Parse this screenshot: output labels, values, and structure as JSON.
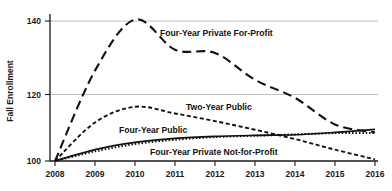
{
  "chart_data": {
    "type": "line",
    "title": "",
    "xlabel": "",
    "ylabel": "Fall Enrollment",
    "x": [
      2008,
      2009,
      2010,
      2011,
      2012,
      2013,
      2014,
      2015,
      2016
    ],
    "xtick_labels": [
      "2008",
      "2009",
      "2010",
      "2011",
      "2012",
      "2013",
      "2014",
      "2015",
      "2016"
    ],
    "ytick_labels": [
      "100",
      "120",
      "140"
    ],
    "yticks": [
      100,
      120,
      140
    ],
    "ylim": [
      100,
      144
    ],
    "xlim": [
      2008,
      2016
    ],
    "grid": "horizontal",
    "legend_position": "inline-annotations",
    "index_base_note": "2008 = 100",
    "series": [
      {
        "name": "Four-Year Private For-Profit",
        "style": "long-dash",
        "dasharray": "9,5",
        "width": 2.1,
        "values": [
          100.0,
          126.5,
          140.4,
          132.2,
          131.3,
          124.0,
          119.0,
          111.0,
          108.6
        ]
      },
      {
        "name": "Two-Year Public",
        "style": "short-dash",
        "dasharray": "4,2.6",
        "width": 1.9,
        "values": [
          100.0,
          111.6,
          116.3,
          114.3,
          112.0,
          109.4,
          106.6,
          103.4,
          100.5
        ]
      },
      {
        "name": "Four-Year Public",
        "style": "solid",
        "dasharray": "none",
        "width": 1.7,
        "values": [
          100.0,
          103.4,
          105.6,
          106.8,
          107.4,
          107.7,
          107.9,
          108.6,
          109.5
        ]
      },
      {
        "name": "Four-Year Private Not-for-Profit",
        "style": "dotted",
        "dasharray": "1.5,1.9",
        "width": 2.0,
        "values": [
          100.0,
          102.9,
          105.1,
          106.4,
          107.2,
          107.6,
          108.0,
          108.4,
          108.4
        ]
      }
    ],
    "annotations": [
      {
        "text": "Four-Year Private For-Profit",
        "x": 160,
        "y": 36,
        "series": "Four-Year Private For-Profit"
      },
      {
        "text": "Two-Year Public",
        "x": 186,
        "y": 110,
        "series": "Two-Year Public"
      },
      {
        "text": "Four-Year Public",
        "x": 119,
        "y": 133,
        "series": "Four-Year Public"
      },
      {
        "text": "Four-Year Private Not-for-Profit",
        "x": 150,
        "y": 155,
        "series": "Four-Year Private Not-for-Profit"
      }
    ]
  },
  "colors": {
    "line": "#111111",
    "grid": "#b9b9b9",
    "axis": "#1a1a1a",
    "background": "#ffffff"
  }
}
